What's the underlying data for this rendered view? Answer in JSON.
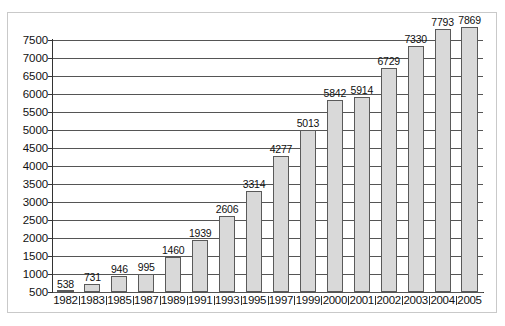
{
  "chart_data": {
    "type": "bar",
    "title": "",
    "subtitle": "",
    "xlabel": "",
    "ylabel": "",
    "categories": [
      "1982",
      "1983",
      "1985",
      "1987",
      "1989",
      "1991",
      "1993",
      "1995",
      "1997",
      "1999",
      "2000",
      "2001",
      "2002",
      "2003",
      "2004",
      "2005"
    ],
    "values": [
      538,
      731,
      946,
      995,
      1460,
      1939,
      2606,
      3314,
      4277,
      5013,
      5842,
      5914,
      6729,
      7330,
      7793,
      7869
    ],
    "series": [
      {
        "name": "",
        "values": [
          538,
          731,
          946,
          995,
          1460,
          1939,
          2606,
          3314,
          4277,
          5013,
          5842,
          5914,
          6729,
          7330,
          7793,
          7869
        ]
      }
    ],
    "data_labels": [
      "538",
      "731",
      "946",
      "995",
      "1460",
      "1939",
      "2606",
      "3314",
      "4277",
      "5013",
      "5842",
      "5914",
      "6729",
      "7330",
      "7793",
      "7869"
    ],
    "ytick_labels": [
      "7500",
      "7000",
      "6500",
      "6000",
      "5500",
      "5000",
      "4500",
      "4000",
      "3500",
      "3000",
      "2500",
      "2000",
      "1500",
      "1000",
      "500"
    ],
    "ytick_values": [
      7500,
      7000,
      6500,
      6000,
      5500,
      5000,
      4500,
      4000,
      3500,
      3000,
      2500,
      2000,
      1500,
      1000,
      500
    ],
    "ylim": [
      500,
      7500
    ],
    "ytick_step": 500,
    "grid": true,
    "grid_axis": "y",
    "legend": false,
    "legend_position": "none",
    "bar_fill_color": "#d9d9d9",
    "bar_border_color": "#5a5a5a",
    "gridline_color": "#555555",
    "axis_color": "#333333",
    "frame_color": "#c9c9c9",
    "background_color": "#ffffff",
    "text_color": "#111111",
    "annotations": []
  },
  "caption": {
    "text": ""
  }
}
